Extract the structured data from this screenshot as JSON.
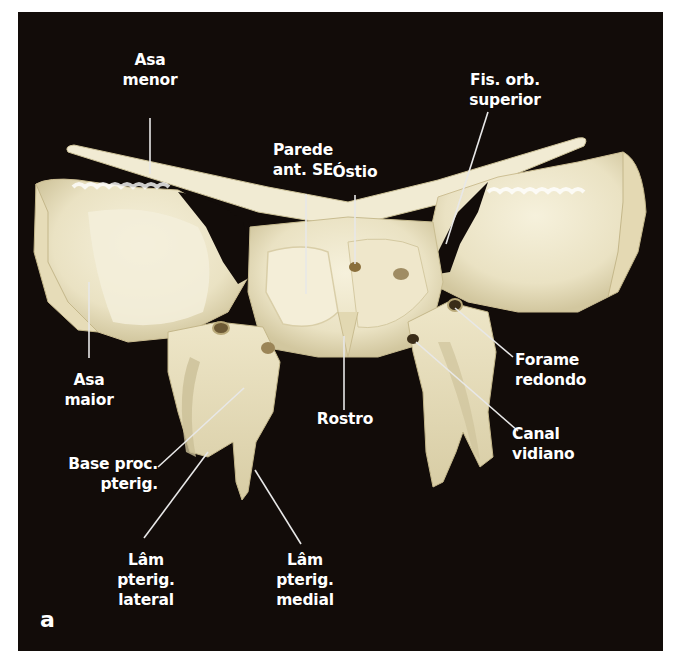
{
  "figure": {
    "panel_letter": "a",
    "background_color": "#120c09",
    "bone_color": "#efe9cf",
    "bone_shadow_color": "#c9bf98",
    "label_color": "#ffffff",
    "leader_color": "#e8e8e8"
  },
  "labels": {
    "asa_menor": {
      "lines": [
        "Asa",
        "menor"
      ]
    },
    "parede_ant_se": {
      "lines": [
        "Parede",
        "ant. SE"
      ]
    },
    "ostio": {
      "lines": [
        "Óstio"
      ]
    },
    "fis_orb_superior": {
      "lines": [
        "Fis. orb.",
        "superior"
      ]
    },
    "asa_maior": {
      "lines": [
        "Asa",
        "maior"
      ]
    },
    "forame_redondo": {
      "lines": [
        "Forame",
        "redondo"
      ]
    },
    "rostro": {
      "lines": [
        "Rostro"
      ]
    },
    "canal_vidiano": {
      "lines": [
        "Canal",
        "vidiano"
      ]
    },
    "base_proc_pterig": {
      "lines": [
        "Base proc.",
        "pterig."
      ]
    },
    "lam_pterig_lateral": {
      "lines": [
        "Lâm",
        "pterig.",
        "lateral"
      ]
    },
    "lam_pterig_medial": {
      "lines": [
        "Lâm",
        "pterig.",
        "medial"
      ]
    }
  }
}
